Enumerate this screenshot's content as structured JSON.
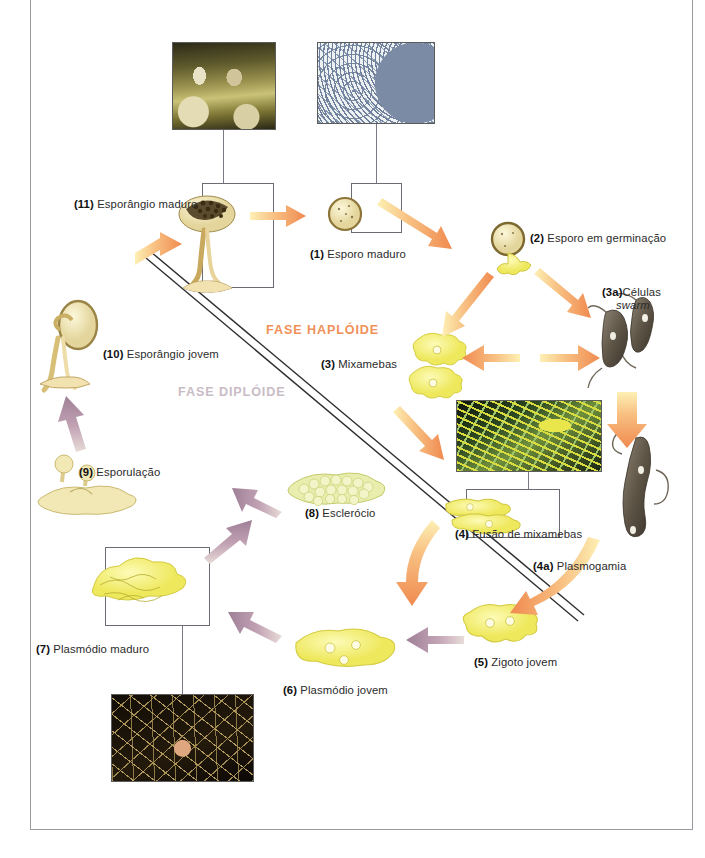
{
  "diagram": {
    "phases": [
      {
        "id": "haploid",
        "label": "FASE HAPLÓIDE",
        "color": "#f0915a"
      },
      {
        "id": "diploid",
        "label": "FASE DIPLÓIDE",
        "color": "#c9bcc6"
      }
    ],
    "stages": [
      {
        "num": "(1)",
        "name": "Esporo maduro",
        "boxed": true
      },
      {
        "num": "(2)",
        "name": "Esporo em germinação",
        "boxed": false
      },
      {
        "num": "(3)",
        "name": "Mixamebas",
        "boxed": false
      },
      {
        "num": "(3a)",
        "name": "Células",
        "name2": "swarm",
        "italic2": true,
        "boxed": false
      },
      {
        "num": "(4)",
        "name": "Fusão de mixamebas",
        "boxed": true
      },
      {
        "num": "(4a)",
        "name": "Plasmogamia",
        "boxed": false
      },
      {
        "num": "(5)",
        "name": "Zigoto jovem",
        "boxed": false
      },
      {
        "num": "(6)",
        "name": "Plasmódio jovem",
        "boxed": false
      },
      {
        "num": "(7)",
        "name": "Plasmódio maduro",
        "boxed": true
      },
      {
        "num": "(8)",
        "name": "Esclerócio",
        "boxed": false
      },
      {
        "num": "(9)",
        "name": "Esporulação",
        "boxed": false
      },
      {
        "num": "(10)",
        "name": "Esporângio jovem",
        "boxed": false
      },
      {
        "num": "(11)",
        "name": "Esporângio maduro",
        "boxed": true
      }
    ],
    "photos": [
      {
        "id": "photo-sporangia",
        "caption": "",
        "links_to": "(11)"
      },
      {
        "id": "photo-spores",
        "caption": "",
        "links_to": "(1)"
      },
      {
        "id": "photo-myxamoebae",
        "caption": "",
        "links_to": "(4)"
      },
      {
        "id": "photo-plasmodium",
        "caption": "",
        "links_to": "(7)"
      }
    ],
    "colors": {
      "haploid_arrow": "#f08a50",
      "haploid_arrow_tail": "#fbe9a0",
      "diploid_arrow": "#a8879e",
      "organism_yellow": "#f6f06a",
      "organism_cream": "#f0e6b4",
      "swarm_cell": "#6b6152",
      "frame_border": "#9a9aa0",
      "box_border": "#6b6b74",
      "divider_line": "#3a3a3a"
    }
  }
}
